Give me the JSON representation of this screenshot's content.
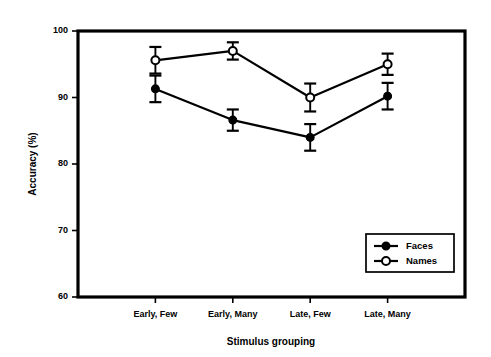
{
  "chart_data": {
    "type": "line",
    "title": "",
    "xlabel": "Stimulus grouping",
    "ylabel": "Accuracy (%)",
    "categories": [
      "Early, Few",
      "Early, Many",
      "Late, Few",
      "Late, Many"
    ],
    "ylim": [
      60,
      100
    ],
    "yticks": [
      60,
      70,
      80,
      90,
      100
    ],
    "ytick_labels": [
      "60",
      "70",
      "80",
      "90",
      "100"
    ],
    "grid": false,
    "legend_position": "lower right",
    "series": [
      {
        "name": "Faces",
        "marker": "filled-circle",
        "values": [
          91.3,
          86.6,
          84.0,
          90.2
        ],
        "errors": [
          2.0,
          1.6,
          2.0,
          2.0
        ]
      },
      {
        "name": "Names",
        "marker": "open-circle",
        "values": [
          95.6,
          97.0,
          90.0,
          95.0
        ],
        "errors": [
          2.0,
          1.3,
          2.1,
          1.6
        ]
      }
    ]
  },
  "axis": {
    "ylabel": "Accuracy (%)",
    "xlabel": "Stimulus grouping"
  },
  "legend": {
    "entries": [
      {
        "label": "Faces"
      },
      {
        "label": "Names"
      }
    ]
  },
  "colors": {
    "ink": "#000000",
    "background": "#ffffff"
  }
}
